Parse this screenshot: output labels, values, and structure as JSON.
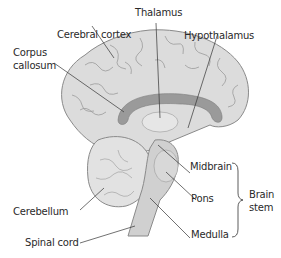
{
  "diagram": {
    "colors": {
      "brain_fill": "#dcdcdc",
      "gyri_line": "#8a8a8a",
      "corpus_callosum": "#9a9a9a",
      "brain_stem": "#d0d0d0",
      "leader_line": "#333333",
      "text": "#2a2a2a"
    },
    "labels": {
      "thalamus": "Thalamus",
      "cerebral_cortex": "Cerebral cortex",
      "hypothalamus": "Hypothalamus",
      "corpus_line1": "Corpus",
      "corpus_line2": "callosum",
      "midbrain": "Midbrain",
      "pons": "Pons",
      "brain_stem_line1": "Brain",
      "brain_stem_line2": "stem",
      "cerebellum": "Cerebellum",
      "medulla": "Medulla",
      "spinal_cord": "Spinal cord"
    }
  }
}
